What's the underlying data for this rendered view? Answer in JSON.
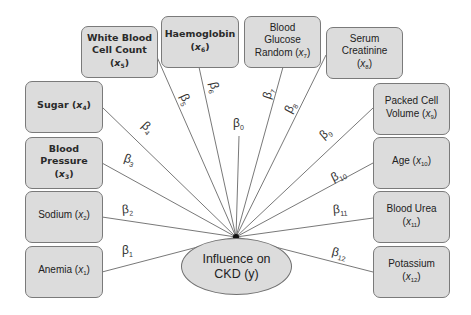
{
  "diagram": {
    "type": "regression-influence-diagram",
    "hub": {
      "x": 236,
      "y": 237
    },
    "target": {
      "line1": "Influence on",
      "line2": "CKD (y)"
    },
    "intercept": {
      "symbol": "β",
      "sub": "0"
    },
    "features": [
      {
        "id": "x1",
        "lines": [
          "Anemia"
        ],
        "var": "x",
        "sub": "1",
        "beta_sub": "1"
      },
      {
        "id": "x2",
        "lines": [
          "Sodium"
        ],
        "var": "x",
        "sub": "2",
        "beta_sub": "2"
      },
      {
        "id": "x3",
        "lines": [
          "Blood",
          "Pressure"
        ],
        "var": "x",
        "sub": "3",
        "beta_sub": "3"
      },
      {
        "id": "x4",
        "lines": [
          "Sugar"
        ],
        "var": "x",
        "sub": "4",
        "beta_sub": "4"
      },
      {
        "id": "x5",
        "lines": [
          "White Blood",
          "Cell Count"
        ],
        "var": "x",
        "sub": "5",
        "beta_sub": "5"
      },
      {
        "id": "x6",
        "lines": [
          "Haemoglobin"
        ],
        "var": "x",
        "sub": "6",
        "beta_sub": "6"
      },
      {
        "id": "x7",
        "lines": [
          "Blood",
          "Glucose",
          "Random"
        ],
        "var": "x",
        "sub": "7",
        "beta_sub": "7"
      },
      {
        "id": "x8",
        "lines": [
          "Serum",
          "Creatinine"
        ],
        "var": "x",
        "sub": "8",
        "beta_sub": "8"
      },
      {
        "id": "x9",
        "lines": [
          "Packed Cell",
          "Volume"
        ],
        "var": "x",
        "sub": "9",
        "beta_sub": "9"
      },
      {
        "id": "x10",
        "lines": [
          "Age"
        ],
        "var": "x",
        "sub": "10",
        "beta_sub": "10"
      },
      {
        "id": "x11",
        "lines": [
          "Blood Urea"
        ],
        "var": "x",
        "sub": "11",
        "beta_sub": "11"
      },
      {
        "id": "x12",
        "lines": [
          "Potassium"
        ],
        "var": "x",
        "sub": "12",
        "beta_sub": "12"
      }
    ],
    "colors": {
      "box_fill": "#dcdcdc",
      "box_border": "#7a7a7a",
      "line": "#555555",
      "background": "#ffffff"
    }
  }
}
